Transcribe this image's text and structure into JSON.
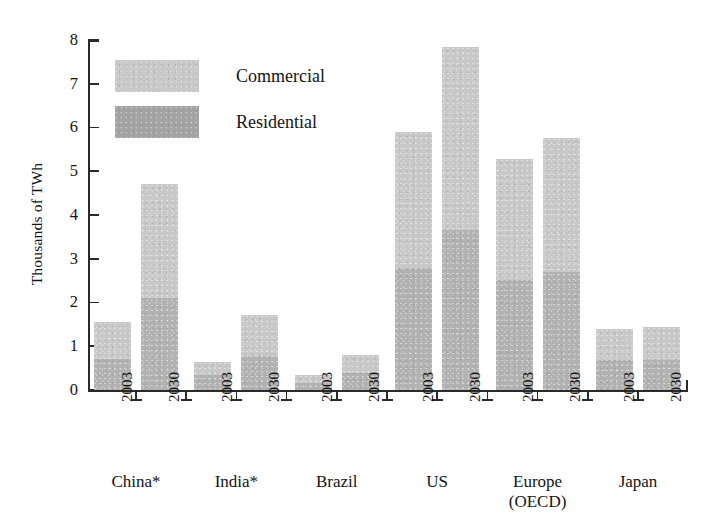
{
  "chart_data": {
    "type": "bar",
    "title": "",
    "subtitle": "",
    "xlabel": "",
    "ylabel": "Thousands of TWh",
    "ylim": [
      0,
      8
    ],
    "yticks": [
      0,
      1,
      2,
      3,
      4,
      5,
      6,
      7,
      8
    ],
    "ytick_labels": [
      "0",
      "1",
      "2",
      "3",
      "4",
      "5",
      "6",
      "7",
      "8"
    ],
    "grid": false,
    "legend_position": "upper-left-inside",
    "legend": [
      "Commercial",
      "Residential"
    ],
    "colors": {
      "commercial": "#c8c8c8",
      "residential": "#a3a3a3",
      "axis": "#2a2a2a",
      "text": "#141414",
      "background": "#ffffff"
    },
    "groups": [
      "China*",
      "India*",
      "Brazil",
      "US",
      "Europe (OECD)",
      "Japan"
    ],
    "group_labels": [
      {
        "line1": "China*",
        "line2": ""
      },
      {
        "line1": "India*",
        "line2": ""
      },
      {
        "line1": "Brazil",
        "line2": ""
      },
      {
        "line1": "US",
        "line2": ""
      },
      {
        "line1": "Europe",
        "line2": "(OECD)"
      },
      {
        "line1": "Japan",
        "line2": ""
      }
    ],
    "categories": [
      "China* 2003",
      "China* 2030",
      "India* 2003",
      "India* 2030",
      "Brazil 2003",
      "Brazil 2030",
      "US 2003",
      "US 2030",
      "Europe (OECD) 2003",
      "Europe (OECD) 2030",
      "Japan 2003",
      "Japan 2030"
    ],
    "xtick_labels": [
      "2003",
      "2030",
      "2003",
      "2030",
      "2003",
      "2030",
      "2003",
      "2030",
      "2003",
      "2030",
      "2003",
      "2030"
    ],
    "values": [
      1.55,
      4.7,
      0.65,
      1.72,
      0.35,
      0.8,
      5.9,
      7.85,
      5.27,
      5.75,
      1.4,
      1.45
    ],
    "series": [
      {
        "name": "Commercial",
        "values": [
          0.85,
          2.6,
          0.3,
          0.95,
          0.18,
          0.42,
          3.1,
          4.2,
          2.75,
          3.05,
          0.72,
          0.76
        ]
      },
      {
        "name": "Residential",
        "values": [
          0.7,
          2.1,
          0.35,
          0.77,
          0.17,
          0.38,
          2.8,
          3.65,
          2.52,
          2.7,
          0.68,
          0.69
        ]
      }
    ],
    "footnote": "* denotes China and India"
  },
  "axis": {
    "y_title": "Thousands of TWh"
  },
  "legend": {
    "items": [
      {
        "label": "Commercial",
        "color": "#c8c8c8"
      },
      {
        "label": "Residential",
        "color": "#a3a3a3"
      }
    ]
  }
}
